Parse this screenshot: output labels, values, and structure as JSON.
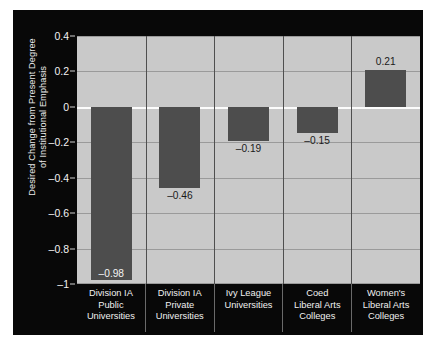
{
  "chart_data": {
    "type": "bar",
    "title": "",
    "xlabel": "",
    "ylabel_line1": "Desired Change from Present Degree",
    "ylabel_line2": "of Institutional Emphasis",
    "categories": [
      "Division IA Public Universities",
      "Division IA Private Universities",
      "Ivy League Universities",
      "Coed Liberal Arts Colleges",
      "Women's Liberal Arts Colleges"
    ],
    "category_lines": [
      [
        "Division IA",
        "Public",
        "Universities"
      ],
      [
        "Division IA",
        "Private",
        "Universities"
      ],
      [
        "Ivy League",
        "Universities"
      ],
      [
        "Coed",
        "Liberal Arts",
        "Colleges"
      ],
      [
        "Women's",
        "Liberal Arts",
        "Colleges"
      ]
    ],
    "values": [
      -0.98,
      -0.46,
      -0.19,
      -0.15,
      0.21
    ],
    "value_labels": [
      "–0.98",
      "–0.46",
      "–0.19",
      "–0.15",
      "0.21"
    ],
    "ylim": [
      -1,
      0.4
    ],
    "yticks": [
      0.4,
      0.2,
      0,
      -0.2,
      -0.4,
      -0.6,
      -0.8,
      -1
    ],
    "ytick_labels": [
      "0.4",
      "0.2",
      "0",
      "–0.2",
      "–0.4",
      "–0.6",
      "–0.8",
      "–1"
    ],
    "grid": true,
    "legend": "none",
    "colors": {
      "bar": "#4d4d4d",
      "plot_background": "#c9c9c9",
      "figure_background": "#080808",
      "gridline": "#9a9a9a",
      "zeroline": "#fcfcfc",
      "axis_text": "#f0f0f0"
    }
  }
}
